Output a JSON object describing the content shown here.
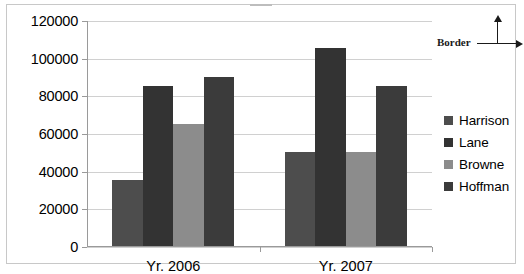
{
  "annotation": {
    "label": "Border"
  },
  "legend": {
    "position": "right",
    "items": [
      {
        "label": "Harrison",
        "color": "#4d4d4d"
      },
      {
        "label": "Lane",
        "color": "#333333"
      },
      {
        "label": "Browne",
        "color": "#8c8c8c"
      },
      {
        "label": "Hoffman",
        "color": "#3b3b3b"
      }
    ]
  },
  "chart_data": {
    "type": "bar",
    "title": "",
    "xlabel": "",
    "ylabel": "",
    "categories": [
      "Yr. 2006",
      "Yr. 2007"
    ],
    "series": [
      {
        "name": "Harrison",
        "color": "#4d4d4d",
        "values": [
          35000,
          50000
        ]
      },
      {
        "name": "Lane",
        "color": "#333333",
        "values": [
          85000,
          105000
        ]
      },
      {
        "name": "Browne",
        "color": "#8c8c8c",
        "values": [
          65000,
          50000
        ]
      },
      {
        "name": "Hoffman",
        "color": "#3b3b3b",
        "values": [
          90000,
          85000
        ]
      }
    ],
    "ylim": [
      0,
      120000
    ],
    "yticks": [
      0,
      20000,
      40000,
      60000,
      80000,
      100000,
      120000
    ],
    "ytick_labels": [
      "0",
      "20000",
      "40000",
      "60000",
      "80000",
      "100000",
      "120000"
    ],
    "grid": true,
    "legend_position": "right"
  }
}
